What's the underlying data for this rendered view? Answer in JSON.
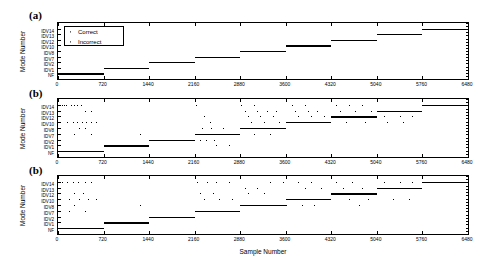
{
  "figure": {
    "xaxis_title": "Sample Number",
    "yaxis_title": "Mode Number",
    "panels": [
      {
        "label": "(a)"
      },
      {
        "label": "(b)"
      },
      {
        "label": "(b)"
      }
    ]
  },
  "legend": {
    "items": [
      {
        "label": "Correct",
        "marker": "dot-marker"
      },
      {
        "label": "Incorrect",
        "marker": "dot-marker"
      }
    ]
  },
  "chart_data": {
    "type": "scatter",
    "title": "",
    "xlabel": "Sample Number",
    "ylabel": "Mode Number",
    "xlim": [
      0,
      6480
    ],
    "ylim": [
      0,
      10
    ],
    "grid": false,
    "legend_position": "upper-left-panel-a",
    "xticks": [
      0,
      720,
      1440,
      2160,
      2880,
      3600,
      4320,
      5040,
      5760,
      6480
    ],
    "yticks": [
      "NF",
      "IDV1",
      "IDV2",
      "IDV7",
      "IDV8",
      "IDV10",
      "IDV12",
      "IDV13",
      "IDV14"
    ],
    "ytick_values": [
      1,
      2,
      3,
      4,
      5,
      6,
      7,
      8,
      9
    ],
    "block_size": 720,
    "true_mode_sequence": [
      {
        "x_start": 0,
        "x_end": 720,
        "mode": "NF",
        "mode_value": 1
      },
      {
        "x_start": 720,
        "x_end": 1440,
        "mode": "IDV1",
        "mode_value": 2
      },
      {
        "x_start": 1440,
        "x_end": 2160,
        "mode": "IDV2",
        "mode_value": 3
      },
      {
        "x_start": 2160,
        "x_end": 2880,
        "mode": "IDV7",
        "mode_value": 4
      },
      {
        "x_start": 2880,
        "x_end": 3600,
        "mode": "IDV8",
        "mode_value": 5
      },
      {
        "x_start": 3600,
        "x_end": 4320,
        "mode": "IDV10",
        "mode_value": 6
      },
      {
        "x_start": 4320,
        "x_end": 5040,
        "mode": "IDV12",
        "mode_value": 7
      },
      {
        "x_start": 5040,
        "x_end": 5760,
        "mode": "IDV13",
        "mode_value": 8
      },
      {
        "x_start": 5760,
        "x_end": 6480,
        "mode": "IDV14",
        "mode_value": 9
      }
    ],
    "series": [
      {
        "name": "(a) Correct",
        "panel": 0,
        "description": "Perfect staircase: every sample classified to its true mode.",
        "segments": [
          {
            "x_start": 0,
            "x_end": 720,
            "mode_value": 1
          },
          {
            "x_start": 720,
            "x_end": 1440,
            "mode_value": 2
          },
          {
            "x_start": 1440,
            "x_end": 2160,
            "mode_value": 3
          },
          {
            "x_start": 2160,
            "x_end": 2880,
            "mode_value": 4
          },
          {
            "x_start": 2880,
            "x_end": 3600,
            "mode_value": 5
          },
          {
            "x_start": 3600,
            "x_end": 4320,
            "mode_value": 6
          },
          {
            "x_start": 4320,
            "x_end": 5040,
            "mode_value": 7
          },
          {
            "x_start": 5040,
            "x_end": 5760,
            "mode_value": 8
          },
          {
            "x_start": 5760,
            "x_end": 6480,
            "mode_value": 9
          }
        ],
        "incorrect_points": []
      },
      {
        "name": "(b) Correct",
        "panel": 1,
        "description": "Staircase with heavy scattered misclassification, densest after sample 2880.",
        "segments": [
          {
            "x_start": 0,
            "x_end": 720,
            "mode_value": 1
          },
          {
            "x_start": 720,
            "x_end": 1440,
            "mode_value": 2
          },
          {
            "x_start": 1440,
            "x_end": 2160,
            "mode_value": 3
          },
          {
            "x_start": 2160,
            "x_end": 2880,
            "mode_value": 4
          },
          {
            "x_start": 2880,
            "x_end": 3600,
            "mode_value": 5
          },
          {
            "x_start": 3600,
            "x_end": 4320,
            "mode_value": 6
          },
          {
            "x_start": 4320,
            "x_end": 5040,
            "mode_value": 7
          },
          {
            "x_start": 5040,
            "x_end": 5760,
            "mode_value": 8
          },
          {
            "x_start": 5760,
            "x_end": 6480,
            "mode_value": 9
          }
        ],
        "incorrect_points": [
          {
            "x": 60,
            "y": 9
          },
          {
            "x": 95,
            "y": 9
          },
          {
            "x": 130,
            "y": 9
          },
          {
            "x": 200,
            "y": 9
          },
          {
            "x": 250,
            "y": 9
          },
          {
            "x": 300,
            "y": 9
          },
          {
            "x": 360,
            "y": 9
          },
          {
            "x": 430,
            "y": 8
          },
          {
            "x": 520,
            "y": 8
          },
          {
            "x": 140,
            "y": 6
          },
          {
            "x": 230,
            "y": 6
          },
          {
            "x": 300,
            "y": 6
          },
          {
            "x": 380,
            "y": 6
          },
          {
            "x": 450,
            "y": 6
          },
          {
            "x": 520,
            "y": 6
          },
          {
            "x": 600,
            "y": 6
          },
          {
            "x": 330,
            "y": 5
          },
          {
            "x": 430,
            "y": 5
          },
          {
            "x": 260,
            "y": 4
          },
          {
            "x": 520,
            "y": 4
          },
          {
            "x": 1300,
            "y": 4
          },
          {
            "x": 2180,
            "y": 9
          },
          {
            "x": 2300,
            "y": 7
          },
          {
            "x": 2400,
            "y": 6
          },
          {
            "x": 2280,
            "y": 5
          },
          {
            "x": 2420,
            "y": 5
          },
          {
            "x": 2600,
            "y": 5
          },
          {
            "x": 2250,
            "y": 3
          },
          {
            "x": 2340,
            "y": 3
          },
          {
            "x": 2460,
            "y": 3
          },
          {
            "x": 2500,
            "y": 2
          },
          {
            "x": 2700,
            "y": 2
          },
          {
            "x": 2900,
            "y": 9
          },
          {
            "x": 3100,
            "y": 9
          },
          {
            "x": 2950,
            "y": 8
          },
          {
            "x": 3150,
            "y": 8
          },
          {
            "x": 3300,
            "y": 8
          },
          {
            "x": 3450,
            "y": 8
          },
          {
            "x": 3000,
            "y": 7
          },
          {
            "x": 3200,
            "y": 7
          },
          {
            "x": 3400,
            "y": 7
          },
          {
            "x": 3050,
            "y": 6
          },
          {
            "x": 3250,
            "y": 6
          },
          {
            "x": 3500,
            "y": 6
          },
          {
            "x": 3100,
            "y": 4
          },
          {
            "x": 3350,
            "y": 4
          },
          {
            "x": 3700,
            "y": 9
          },
          {
            "x": 3900,
            "y": 9
          },
          {
            "x": 3750,
            "y": 8
          },
          {
            "x": 3950,
            "y": 8
          },
          {
            "x": 4100,
            "y": 8
          },
          {
            "x": 3800,
            "y": 7
          },
          {
            "x": 4000,
            "y": 7
          },
          {
            "x": 4200,
            "y": 7
          },
          {
            "x": 3850,
            "y": 6
          },
          {
            "x": 4050,
            "y": 6
          },
          {
            "x": 4400,
            "y": 9
          },
          {
            "x": 4600,
            "y": 9
          },
          {
            "x": 4800,
            "y": 9
          },
          {
            "x": 4450,
            "y": 8
          },
          {
            "x": 4700,
            "y": 8
          },
          {
            "x": 4950,
            "y": 8
          },
          {
            "x": 4500,
            "y": 7
          },
          {
            "x": 4750,
            "y": 7
          },
          {
            "x": 4550,
            "y": 6
          },
          {
            "x": 4850,
            "y": 6
          },
          {
            "x": 5100,
            "y": 8
          },
          {
            "x": 5300,
            "y": 8
          },
          {
            "x": 5500,
            "y": 8
          },
          {
            "x": 5150,
            "y": 7
          },
          {
            "x": 5400,
            "y": 7
          },
          {
            "x": 5600,
            "y": 7
          },
          {
            "x": 5200,
            "y": 6
          },
          {
            "x": 5450,
            "y": 6
          }
        ]
      },
      {
        "name": "(b) Correct",
        "panel": 2,
        "description": "Staircase with moderate scattered misclassification, cleaner than panel two.",
        "segments": [
          {
            "x_start": 0,
            "x_end": 720,
            "mode_value": 1
          },
          {
            "x_start": 720,
            "x_end": 1440,
            "mode_value": 2
          },
          {
            "x_start": 1440,
            "x_end": 2160,
            "mode_value": 3
          },
          {
            "x_start": 2160,
            "x_end": 2880,
            "mode_value": 4
          },
          {
            "x_start": 2880,
            "x_end": 3600,
            "mode_value": 5
          },
          {
            "x_start": 3600,
            "x_end": 4320,
            "mode_value": 6
          },
          {
            "x_start": 4320,
            "x_end": 5040,
            "mode_value": 7
          },
          {
            "x_start": 5040,
            "x_end": 5760,
            "mode_value": 8
          },
          {
            "x_start": 5760,
            "x_end": 6480,
            "mode_value": 9
          }
        ],
        "incorrect_points": [
          {
            "x": 70,
            "y": 9
          },
          {
            "x": 140,
            "y": 9
          },
          {
            "x": 230,
            "y": 9
          },
          {
            "x": 320,
            "y": 9
          },
          {
            "x": 420,
            "y": 9
          },
          {
            "x": 520,
            "y": 9
          },
          {
            "x": 260,
            "y": 7
          },
          {
            "x": 400,
            "y": 7
          },
          {
            "x": 180,
            "y": 6
          },
          {
            "x": 330,
            "y": 6
          },
          {
            "x": 470,
            "y": 6
          },
          {
            "x": 600,
            "y": 6
          },
          {
            "x": 250,
            "y": 5
          },
          {
            "x": 180,
            "y": 4
          },
          {
            "x": 420,
            "y": 4
          },
          {
            "x": 1300,
            "y": 5
          },
          {
            "x": 2200,
            "y": 9
          },
          {
            "x": 2350,
            "y": 9
          },
          {
            "x": 2500,
            "y": 9
          },
          {
            "x": 2700,
            "y": 9
          },
          {
            "x": 2250,
            "y": 7
          },
          {
            "x": 2450,
            "y": 7
          },
          {
            "x": 2300,
            "y": 6
          },
          {
            "x": 2550,
            "y": 6
          },
          {
            "x": 2750,
            "y": 6
          },
          {
            "x": 2400,
            "y": 4
          },
          {
            "x": 2650,
            "y": 4
          },
          {
            "x": 2950,
            "y": 8
          },
          {
            "x": 3150,
            "y": 8
          },
          {
            "x": 3000,
            "y": 7
          },
          {
            "x": 3250,
            "y": 7
          },
          {
            "x": 3350,
            "y": 9
          },
          {
            "x": 3550,
            "y": 9
          },
          {
            "x": 3400,
            "y": 5
          },
          {
            "x": 3600,
            "y": 5
          },
          {
            "x": 3800,
            "y": 9
          },
          {
            "x": 4000,
            "y": 9
          },
          {
            "x": 3900,
            "y": 8
          },
          {
            "x": 4150,
            "y": 8
          },
          {
            "x": 3850,
            "y": 5
          },
          {
            "x": 4050,
            "y": 5
          },
          {
            "x": 4400,
            "y": 9
          },
          {
            "x": 4650,
            "y": 9
          },
          {
            "x": 4500,
            "y": 8
          },
          {
            "x": 4800,
            "y": 8
          },
          {
            "x": 4600,
            "y": 6
          },
          {
            "x": 4900,
            "y": 6
          },
          {
            "x": 4750,
            "y": 5
          },
          {
            "x": 5150,
            "y": 9
          },
          {
            "x": 5400,
            "y": 9
          },
          {
            "x": 5600,
            "y": 9
          },
          {
            "x": 5200,
            "y": 8
          },
          {
            "x": 5500,
            "y": 8
          },
          {
            "x": 5300,
            "y": 6
          },
          {
            "x": 5550,
            "y": 6
          }
        ]
      }
    ]
  }
}
